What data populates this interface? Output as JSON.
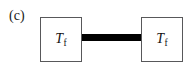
{
  "figure": {
    "panel_label": "(c)",
    "background_color": "#ffffff",
    "nodes": [
      {
        "id": "left",
        "symbol": "T",
        "subscript": "f",
        "border_color": "#58585a",
        "fill_color": "#ffffff"
      },
      {
        "id": "right",
        "symbol": "T",
        "subscript": "f",
        "border_color": "#58585a",
        "fill_color": "#ffffff"
      }
    ],
    "connector": {
      "style": "thick-solid-bar",
      "color": "#000000"
    }
  },
  "chart_data": {
    "type": "diagram",
    "title": "(c)",
    "nodes": [
      {
        "id": "left",
        "label": "T_f",
        "x": 61,
        "y": 39,
        "width": 42,
        "height": 45,
        "shape": "square"
      },
      {
        "id": "right",
        "label": "T_f",
        "x": 162,
        "y": 39,
        "width": 42,
        "height": 45,
        "shape": "square"
      }
    ],
    "edges": [
      {
        "from": "left",
        "to": "right",
        "style": "thick-solid",
        "thickness_px": 7,
        "color": "#000000"
      }
    ]
  }
}
